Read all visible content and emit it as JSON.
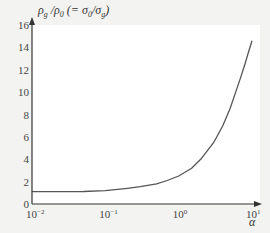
{
  "chart_data": {
    "type": "line",
    "title": "",
    "ylabel": "ρg/ρ0 (= σ0/σg)",
    "ylabel_parts": {
      "main": "ρ",
      "sub1": "g",
      "slash": " /ρ",
      "sub2": "0",
      "paren": " (= σ",
      "sub3": "0",
      "slash2": "/σ",
      "sub4": "g",
      "close": ")"
    },
    "xlabel": "α",
    "xscale": "log",
    "xlim": [
      0.01,
      10
    ],
    "ylim": [
      0,
      16
    ],
    "grid": false,
    "legend": null,
    "y_ticks": [
      0,
      2,
      4,
      6,
      8,
      10,
      12,
      14,
      16
    ],
    "y_tick_labels": [
      "0",
      "2",
      "4",
      "6",
      "8",
      "10",
      "12",
      "14",
      "16"
    ],
    "x_ticks": [
      0.01,
      0.1,
      1,
      10
    ],
    "x_tick_labels": [
      {
        "base": "10",
        "exp": "−2"
      },
      {
        "base": "10",
        "exp": "−1"
      },
      {
        "base": "10",
        "exp": "0"
      },
      {
        "base": "10",
        "exp": "1"
      }
    ],
    "series": [
      {
        "name": "ρg/ρ0",
        "color": "#555555",
        "x": [
          0.01,
          0.02,
          0.05,
          0.1,
          0.2,
          0.3,
          0.5,
          0.7,
          1.0,
          1.5,
          2.0,
          3.0,
          4.0,
          5.0,
          6.0,
          7.0,
          8.0,
          9.0,
          10.0
        ],
        "values": [
          1.1,
          1.1,
          1.12,
          1.2,
          1.4,
          1.55,
          1.8,
          2.1,
          2.5,
          3.2,
          4.0,
          5.5,
          7.0,
          8.5,
          10.0,
          11.3,
          12.5,
          13.6,
          14.6
        ]
      }
    ]
  }
}
